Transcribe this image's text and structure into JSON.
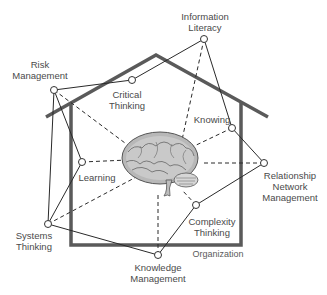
{
  "diagram": {
    "type": "concept-house",
    "center": {
      "label": "brain",
      "x": 168,
      "y": 165
    },
    "house": {
      "roof": {
        "left": [
          46,
          117
        ],
        "peak": [
          156,
          55
        ],
        "right": [
          268,
          117
        ],
        "color": "#5a5a5a"
      },
      "walls": {
        "left_x": 71,
        "right_x": 241,
        "top_y": 103,
        "bottom_y": 245,
        "color": "#5a5a5a"
      },
      "label": "Organization"
    },
    "nodes": [
      {
        "id": "information-literacy",
        "lines": [
          "Information",
          "Literacy"
        ],
        "x": 204,
        "y": 39,
        "label_x": 205,
        "label_y": 11
      },
      {
        "id": "risk-management",
        "lines": [
          "Risk",
          "Management"
        ],
        "x": 54,
        "y": 90,
        "label_x": 40,
        "label_y": 59
      },
      {
        "id": "critical-thinking",
        "lines": [
          "Critical",
          "Thinking"
        ],
        "x": 132,
        "y": 80,
        "label_x": 127,
        "label_y": 89
      },
      {
        "id": "knowing",
        "lines": [
          "Knowing"
        ],
        "x": 232,
        "y": 128,
        "label_x": 212,
        "label_y": 114
      },
      {
        "id": "learning",
        "lines": [
          "Learning"
        ],
        "x": 82,
        "y": 162,
        "label_x": 97,
        "label_y": 172
      },
      {
        "id": "relationship-network-management",
        "lines": [
          "Relationship",
          "Network",
          "Management"
        ],
        "x": 264,
        "y": 163,
        "label_x": 290,
        "label_y": 170
      },
      {
        "id": "systems-thinking",
        "lines": [
          "Systems",
          "Thinking"
        ],
        "x": 48,
        "y": 224,
        "label_x": 34,
        "label_y": 230
      },
      {
        "id": "complexity-thinking",
        "lines": [
          "Complexity",
          "Thinking"
        ],
        "x": 196,
        "y": 205,
        "label_x": 212,
        "label_y": 216
      },
      {
        "id": "knowledge-management",
        "lines": [
          "Knowledge",
          "Management"
        ],
        "x": 158,
        "y": 255,
        "label_x": 158,
        "label_y": 262
      }
    ],
    "solid_edges": [
      [
        "risk-management",
        "critical-thinking"
      ],
      [
        "critical-thinking",
        "information-literacy"
      ],
      [
        "information-literacy",
        "knowing"
      ],
      [
        "knowing",
        "relationship-network-management"
      ],
      [
        "relationship-network-management",
        "complexity-thinking"
      ],
      [
        "complexity-thinking",
        "knowledge-management"
      ],
      [
        "knowledge-management",
        "systems-thinking"
      ],
      [
        "systems-thinking",
        "learning"
      ],
      [
        "learning",
        "risk-management"
      ],
      [
        "risk-management",
        "systems-thinking"
      ]
    ],
    "dashed_edges_to_center": [
      {
        "node": "risk-management",
        "end": [
          125,
          143
        ]
      },
      {
        "node": "information-literacy",
        "end": [
          182,
          140
        ]
      },
      {
        "node": "knowing",
        "end": [
          190,
          148
        ]
      },
      {
        "node": "learning",
        "end": [
          128,
          160
        ]
      },
      {
        "node": "relationship-network-management",
        "end": [
          204,
          163
        ]
      },
      {
        "node": "systems-thinking",
        "end": [
          140,
          175
        ]
      },
      {
        "node": "complexity-thinking",
        "end": [
          182,
          190
        ]
      },
      {
        "node": "knowledge-management",
        "end": [
          158,
          195
        ]
      }
    ],
    "organization_label": {
      "text": "Organization",
      "x": 218,
      "y": 249
    },
    "colors": {
      "line": "#2a2a2a",
      "house": "#5a5a5a",
      "text": "#4a4a4a",
      "node_fill": "#ffffff"
    }
  }
}
